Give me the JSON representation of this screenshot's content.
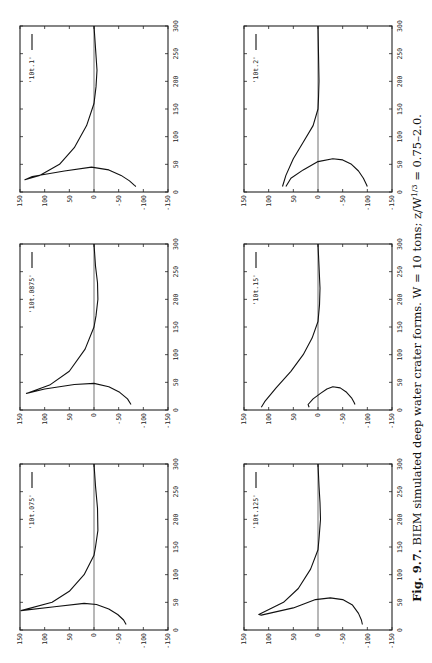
{
  "figure": {
    "caption_label": "Fig. 9.7.",
    "caption_text": "BIEM simulated deep water crater forms.",
    "caption_params": "W = 10 tons; z/W",
    "caption_exp": "1/3",
    "caption_tail": " = 0.75–2.0."
  },
  "chart_data": [
    {
      "type": "line",
      "legend": "'10t.1'",
      "panel": "left-top",
      "xlim": [
        0,
        300
      ],
      "ylim": [
        -150,
        150
      ],
      "xticks": [
        "0",
        "50",
        "100",
        "150",
        "200",
        "250",
        "300"
      ],
      "yticks": [
        "150",
        "100",
        "50",
        "0",
        "-50",
        "-100",
        "-150"
      ],
      "series": [
        {
          "name": "crater profile",
          "x": [
            300,
            260,
            220,
            190,
            160,
            120,
            80,
            50,
            30,
            22,
            28,
            38,
            45,
            40,
            30,
            20,
            12,
            10
          ],
          "y": [
            0,
            -3,
            -6,
            -4,
            0,
            15,
            40,
            70,
            110,
            140,
            125,
            60,
            5,
            -30,
            -55,
            -72,
            -82,
            -85
          ]
        }
      ]
    },
    {
      "type": "line",
      "legend": "'10t.0875'",
      "panel": "left-middle",
      "xlim": [
        0,
        300
      ],
      "ylim": [
        -150,
        150
      ],
      "xticks": [
        "0",
        "50",
        "100",
        "150",
        "200",
        "250",
        "300"
      ],
      "yticks": [
        "150",
        "100",
        "50",
        "0",
        "-50",
        "-100",
        "-150"
      ],
      "series": [
        {
          "name": "crater profile",
          "x": [
            300,
            260,
            230,
            200,
            170,
            150,
            110,
            70,
            45,
            30,
            38,
            46,
            48,
            42,
            32,
            20,
            10
          ],
          "y": [
            0,
            -3,
            -7,
            -8,
            -4,
            0,
            18,
            50,
            90,
            137,
            100,
            40,
            0,
            -30,
            -52,
            -68,
            -75
          ]
        }
      ]
    },
    {
      "type": "line",
      "legend": "'10t.075'",
      "panel": "left-bottom",
      "xlim": [
        0,
        300
      ],
      "ylim": [
        -150,
        150
      ],
      "xticks": [
        "0",
        "50",
        "100",
        "150",
        "200",
        "250",
        "300"
      ],
      "yticks": [
        "150",
        "100",
        "50",
        "0",
        "-50",
        "-100",
        "-150"
      ],
      "series": [
        {
          "name": "crater profile",
          "x": [
            300,
            260,
            220,
            180,
            150,
            135,
            100,
            70,
            50,
            35,
            42,
            48,
            46,
            38,
            28,
            18,
            10
          ],
          "y": [
            0,
            -3,
            -7,
            -8,
            -3,
            0,
            20,
            50,
            85,
            148,
            80,
            20,
            -5,
            -30,
            -48,
            -60,
            -65
          ]
        }
      ]
    },
    {
      "type": "line",
      "legend": "'10t.125'",
      "panel": "right-bottom",
      "xlim": [
        0,
        300
      ],
      "ylim": [
        -150,
        150
      ],
      "xticks": [
        "0",
        "50",
        "100",
        "150",
        "200",
        "250",
        "300"
      ],
      "yticks": [
        "150",
        "100",
        "50",
        "0",
        "-50",
        "-100",
        "-150"
      ],
      "series": [
        {
          "name": "crater profile",
          "x": [
            300,
            260,
            230,
            200,
            165,
            145,
            110,
            75,
            50,
            28,
            27,
            40,
            55,
            58,
            55,
            45,
            30,
            18,
            10
          ],
          "y": [
            0,
            -2,
            -4,
            -5,
            -2,
            0,
            15,
            40,
            70,
            120,
            115,
            50,
            5,
            -25,
            -50,
            -70,
            -82,
            -88,
            -90
          ]
        }
      ]
    },
    {
      "type": "line",
      "legend": "'10t.15'",
      "panel": "right-middle",
      "xlim": [
        0,
        300
      ],
      "ylim": [
        -150,
        150
      ],
      "xticks": [
        "0",
        "50",
        "100",
        "150",
        "200",
        "250",
        "300"
      ],
      "yticks": [
        "150",
        "100",
        "50",
        "0",
        "-50",
        "-100",
        "-150"
      ],
      "series": [
        {
          "name": "crater lip",
          "x": [
            300,
            260,
            220,
            190,
            160,
            130,
            100,
            70,
            40,
            15,
            5
          ],
          "y": [
            0,
            -2,
            -4,
            -3,
            0,
            12,
            30,
            55,
            85,
            108,
            115
          ]
        },
        {
          "name": "crater cavity",
          "x": [
            5,
            10,
            20,
            30,
            38,
            42,
            40,
            32,
            22,
            14,
            10
          ],
          "y": [
            18,
            20,
            10,
            -5,
            -18,
            -30,
            -45,
            -58,
            -68,
            -73,
            -75
          ]
        }
      ]
    },
    {
      "type": "line",
      "legend": "'10t.2'",
      "panel": "right-top",
      "xlim": [
        0,
        300
      ],
      "ylim": [
        -150,
        150
      ],
      "xticks": [
        "0",
        "50",
        "100",
        "150",
        "200",
        "250",
        "300"
      ],
      "yticks": [
        "150",
        "100",
        "50",
        "0",
        "-50",
        "-100",
        "-150"
      ],
      "series": [
        {
          "name": "crater lip",
          "x": [
            300,
            250,
            200,
            170,
            150,
            120,
            90,
            60,
            30,
            10
          ],
          "y": [
            0,
            -1,
            -2,
            -1,
            0,
            10,
            30,
            50,
            65,
            72
          ]
        },
        {
          "name": "crater cavity",
          "x": [
            10,
            25,
            40,
            55,
            60,
            58,
            50,
            38,
            25,
            14,
            10
          ],
          "y": [
            65,
            55,
            30,
            0,
            -30,
            -50,
            -68,
            -82,
            -92,
            -98,
            -100
          ]
        }
      ]
    }
  ]
}
